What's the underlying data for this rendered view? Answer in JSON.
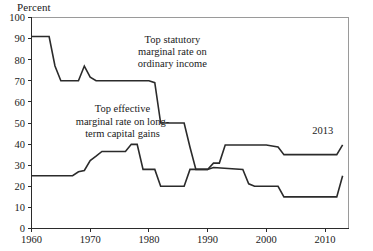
{
  "chart_data": {
    "type": "line",
    "title": "",
    "ylabel": "Percent",
    "xlabel": "",
    "ylim": [
      0,
      100
    ],
    "xlim": [
      1960,
      2014
    ],
    "yticks": [
      0,
      10,
      20,
      30,
      40,
      50,
      60,
      70,
      80,
      90,
      100
    ],
    "ytick_labels": [
      "0",
      "10",
      "20",
      "30",
      "40",
      "50",
      "60",
      "70",
      "80",
      "90",
      "100"
    ],
    "xticks": [
      1960,
      1970,
      1980,
      1990,
      2000,
      2010
    ],
    "xtick_labels": [
      "1960",
      "1970",
      "1980",
      "1990",
      "2000",
      "2010"
    ],
    "grid": false,
    "legend": "annotations-inline",
    "annotations": [
      {
        "name": "statutory-label",
        "lines": [
          "Top statutory",
          "marginal rate on",
          "ordinary income"
        ],
        "x": 1984.0,
        "y": 88.0
      },
      {
        "name": "capital-gains-label",
        "lines": [
          "Top effective",
          "marginal rate on long-",
          "term capital gains"
        ],
        "x": 1975.5,
        "y": 55.0
      },
      {
        "name": "year-marker-2013",
        "lines": [
          "2013"
        ],
        "x": 2009.6,
        "y": 45.0
      }
    ],
    "series": [
      {
        "name": "Top statutory marginal rate on ordinary income",
        "color": "#2b2b2b",
        "points": [
          [
            1960,
            91.0
          ],
          [
            1963,
            91.0
          ],
          [
            1964,
            77.0
          ],
          [
            1965,
            70.0
          ],
          [
            1968,
            70.0
          ],
          [
            1969,
            77.0
          ],
          [
            1970,
            71.75
          ],
          [
            1971,
            70.0
          ],
          [
            1980,
            70.0
          ],
          [
            1981,
            69.125
          ],
          [
            1982,
            50.0
          ],
          [
            1986,
            50.0
          ],
          [
            1987,
            38.5
          ],
          [
            1988,
            28.0
          ],
          [
            1990,
            28.0
          ],
          [
            1991,
            31.0
          ],
          [
            1992,
            31.0
          ],
          [
            1993,
            39.6
          ],
          [
            2000,
            39.6
          ],
          [
            2001,
            39.1
          ],
          [
            2002,
            38.6
          ],
          [
            2003,
            35.0
          ],
          [
            2012,
            35.0
          ],
          [
            2013,
            39.6
          ]
        ]
      },
      {
        "name": "Top effective marginal rate on long-term capital gains",
        "color": "#2b2b2b",
        "points": [
          [
            1960,
            25.0
          ],
          [
            1967,
            25.0
          ],
          [
            1968,
            26.9
          ],
          [
            1969,
            27.5
          ],
          [
            1970,
            32.21
          ],
          [
            1971,
            34.25
          ],
          [
            1972,
            36.5
          ],
          [
            1976,
            36.5
          ],
          [
            1977,
            39.875
          ],
          [
            1978,
            39.875
          ],
          [
            1979,
            28.0
          ],
          [
            1981,
            28.0
          ],
          [
            1982,
            20.0
          ],
          [
            1986,
            20.0
          ],
          [
            1987,
            28.0
          ],
          [
            1990,
            28.0
          ],
          [
            1991,
            28.93
          ],
          [
            1996,
            28.0
          ],
          [
            1997,
            21.19
          ],
          [
            1998,
            20.0
          ],
          [
            2002,
            20.0
          ],
          [
            2003,
            15.0
          ],
          [
            2012,
            15.0
          ],
          [
            2013,
            25.0
          ]
        ]
      }
    ]
  },
  "figure": {
    "unit_label": "Percent"
  }
}
